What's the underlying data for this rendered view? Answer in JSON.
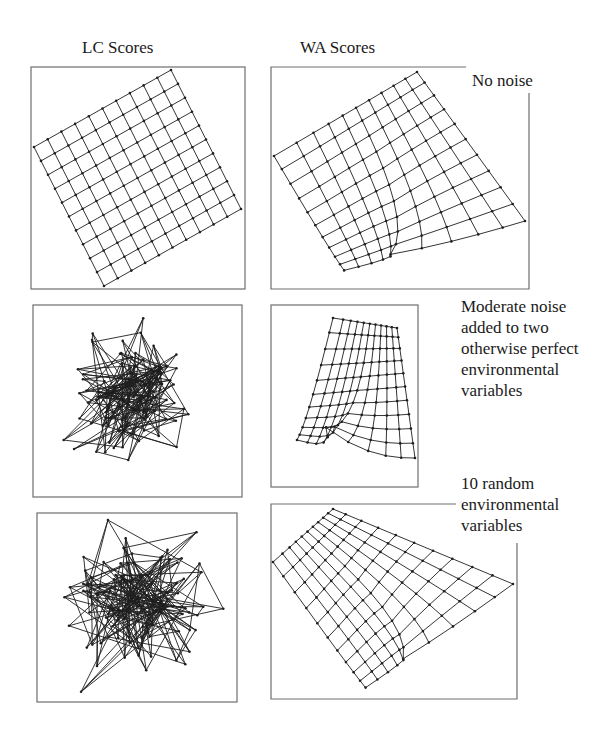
{
  "figure": {
    "column_titles": [
      "LC Scores",
      "WA Scores"
    ],
    "rows": [
      {
        "label_lines": [
          "No noise"
        ]
      },
      {
        "label_lines": [
          "Moderate noise",
          "added to two",
          "otherwise perfect",
          "environmental",
          "variables"
        ]
      },
      {
        "label_lines": [
          "10 random",
          "environmental",
          "variables"
        ]
      }
    ]
  },
  "chart_data": [
    {
      "type": "scatter",
      "panel": "LC Scores — No noise",
      "description": "Regular 11x11 grid of site scores, rotated ~27 degrees",
      "grid_nodes": [
        11,
        11
      ],
      "corners": {
        "left": [
          34,
          147
        ],
        "top": [
          171,
          70
        ],
        "right": [
          241,
          209
        ],
        "bottom": [
          104,
          286
        ]
      }
    },
    {
      "type": "scatter",
      "panel": "WA Scores — No noise",
      "description": "Warped 11x11 grid, nodes compressed toward lower-left",
      "grid_nodes": [
        11,
        11
      ]
    },
    {
      "type": "scatter",
      "panel": "LC Scores — Moderate noise added to two otherwise perfect environmental variables",
      "description": "Grid connectivity with heavily scrambled node positions",
      "grid_nodes": [
        11,
        11
      ]
    },
    {
      "type": "scatter",
      "panel": "WA Scores — Moderate noise added to two otherwise perfect environmental variables",
      "description": "Warped grid, compressed toward left edge",
      "grid_nodes": [
        11,
        11
      ]
    },
    {
      "type": "scatter",
      "panel": "LC Scores — 10 random environmental variables",
      "description": "Grid connectivity with random node positions, dense tangle",
      "grid_nodes": [
        11,
        11
      ]
    },
    {
      "type": "scatter",
      "panel": "WA Scores — 10 random environmental variables",
      "description": "Warped grid, compressed toward bottom-center",
      "grid_nodes": [
        11,
        11
      ]
    }
  ],
  "layout": {
    "panels": [
      {
        "id": "lc-1",
        "frame": [
          31,
          67,
          245,
          289
        ],
        "kind": "grid",
        "corners": [
          [
            34,
            147
          ],
          [
            171,
            70
          ],
          [
            241,
            209
          ],
          [
            104,
            286
          ]
        ]
      },
      {
        "id": "wa-1",
        "frame": [
          271,
          67,
          529,
          289
        ],
        "open_top_right": [
          466,
          93
        ],
        "kind": "warp",
        "corners": [
          [
            274,
            156
          ],
          [
            417,
            72
          ],
          [
            525,
            221
          ],
          [
            343,
            283
          ]
        ],
        "pinch": [
          345,
          260
        ],
        "pinch_strength": 0.55
      },
      {
        "id": "lc-2",
        "frame": [
          33,
          305,
          242,
          497
        ],
        "kind": "noise",
        "seed": 7,
        "spread": 0.38,
        "center": [
          138,
          392
        ]
      },
      {
        "id": "wa-2",
        "frame": [
          271,
          305,
          418,
          487
        ],
        "kind": "warp",
        "corners": [
          [
            333,
            318
          ],
          [
            397,
            328
          ],
          [
            415,
            458
          ],
          [
            305,
            492
          ]
        ],
        "pinch": [
          289,
          388
        ],
        "pinch_strength": 0.5
      },
      {
        "id": "lc-3",
        "frame": [
          37,
          513,
          237,
          702
        ],
        "kind": "noise",
        "seed": 23,
        "spread": 0.5,
        "center": [
          140,
          603
        ]
      },
      {
        "id": "wa-3",
        "frame": [
          271,
          504,
          517,
          699
        ],
        "open_top_right": [
          456,
          543
        ],
        "kind": "warp",
        "corners": [
          [
            273,
            562
          ],
          [
            333,
            509
          ],
          [
            513,
            584
          ],
          [
            365,
            697
          ]
        ],
        "pinch": [
          366,
          680
        ],
        "pinch_strength": 0.55
      }
    ],
    "column_title_pos": [
      [
        82,
        38
      ],
      [
        300,
        38
      ]
    ],
    "row_label_pos": [
      [
        472,
        70
      ],
      [
        461,
        296
      ],
      [
        461,
        473
      ]
    ]
  }
}
